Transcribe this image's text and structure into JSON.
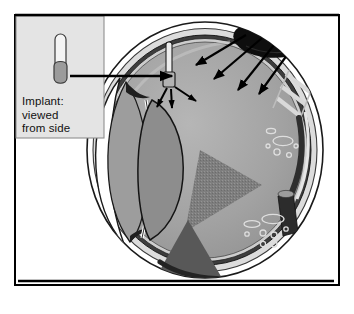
{
  "figure": {
    "kind": "anatomical-diagram",
    "canvas": {
      "width": 354,
      "height": 314,
      "background": "#ffffff"
    }
  },
  "frame": {
    "name": "outer-border",
    "stroke": "#000000",
    "stroke_width": 2,
    "x": 14,
    "y": 14,
    "width": 326,
    "height": 272
  },
  "inset": {
    "name": "implant-inset-panel",
    "x": 16,
    "y": 16,
    "width": 88,
    "height": 122,
    "fill": "#e4e4e4",
    "stroke": "#8a8a8a",
    "caption_lines": [
      "Implant:",
      "viewed",
      "from side"
    ],
    "caption_text": "Implant: viewed from side",
    "implant_icon": {
      "name": "implant-side-view-icon",
      "shaft_fill": "#f2f2f2",
      "bulb_fill": "#9a9a9a",
      "outline": "#3a3a3a"
    }
  },
  "pointer": {
    "name": "inset-to-eye-arrow",
    "label": "",
    "color": "#000000",
    "from_x": 58,
    "from_y": 76,
    "to_x": 172,
    "to_y": 76
  },
  "eye": {
    "name": "eye-globe",
    "center_x": 205,
    "center_y": 150,
    "radius_x": 118,
    "radius_y": 128,
    "sclera_outer_fill": "#ffffff",
    "sclera_band_fill": "#d8d8d8",
    "choroid_fill": "#3c3c3c",
    "vitreous_fill": "#9e9e9e",
    "vitreous_fill_light": "#b4b4b4",
    "outline": "#1a1a1a",
    "parts": [
      {
        "name": "sclera",
        "label": "Sclera"
      },
      {
        "name": "choroid",
        "label": "Choroid"
      },
      {
        "name": "retina",
        "label": "Retina"
      },
      {
        "name": "vitreous-body",
        "label": "Vitreous body"
      },
      {
        "name": "cornea",
        "label": "Cornea"
      },
      {
        "name": "lens",
        "label": "Lens"
      },
      {
        "name": "anterior-chamber",
        "label": "Anterior chamber"
      },
      {
        "name": "ciliary-body",
        "label": "Ciliary body"
      },
      {
        "name": "optic-nerve",
        "label": "Optic nerve"
      }
    ]
  },
  "lens": {
    "name": "lens",
    "fill": "#8e8e8e",
    "outline": "#1a1a1a",
    "center_x": 136,
    "center_y": 176,
    "radius_x": 34,
    "radius_y": 58
  },
  "tumor": {
    "name": "tumor-mass",
    "fill": "#101010",
    "label": "",
    "position": "superior-posterior"
  },
  "tumor_arrows": {
    "name": "radiation-arrows-from-tumor",
    "count": 4,
    "color": "#000000"
  },
  "implant_in_eye": {
    "name": "implant-in-vitreous",
    "shaft_fill": "#e8e8e8",
    "head_fill": "#b0b0b0",
    "outline": "#1f1f1f",
    "arrow_count": 3,
    "arrow_color": "#000000"
  },
  "triangle": {
    "name": "visual-axis-triangle",
    "fill": "#7e7e7e",
    "texture": "dither",
    "points": "200,150 262,185 185,232"
  },
  "wedge": {
    "name": "lower-pointer-wedge",
    "fill": "#5a5a5a",
    "points": "186,222 232,300 152,286"
  },
  "baseline": {
    "name": "baseline-rule",
    "color": "#000000",
    "x1": 18,
    "y1": 281,
    "x2": 334,
    "y2": 281
  },
  "cell_marks": {
    "name": "cellular-detail-marks",
    "color": "#d5d5d5",
    "count": 14
  },
  "ciliary_ladder": {
    "name": "ciliary-body-ladder",
    "color": "#cfcfcf",
    "rungs": 3
  }
}
